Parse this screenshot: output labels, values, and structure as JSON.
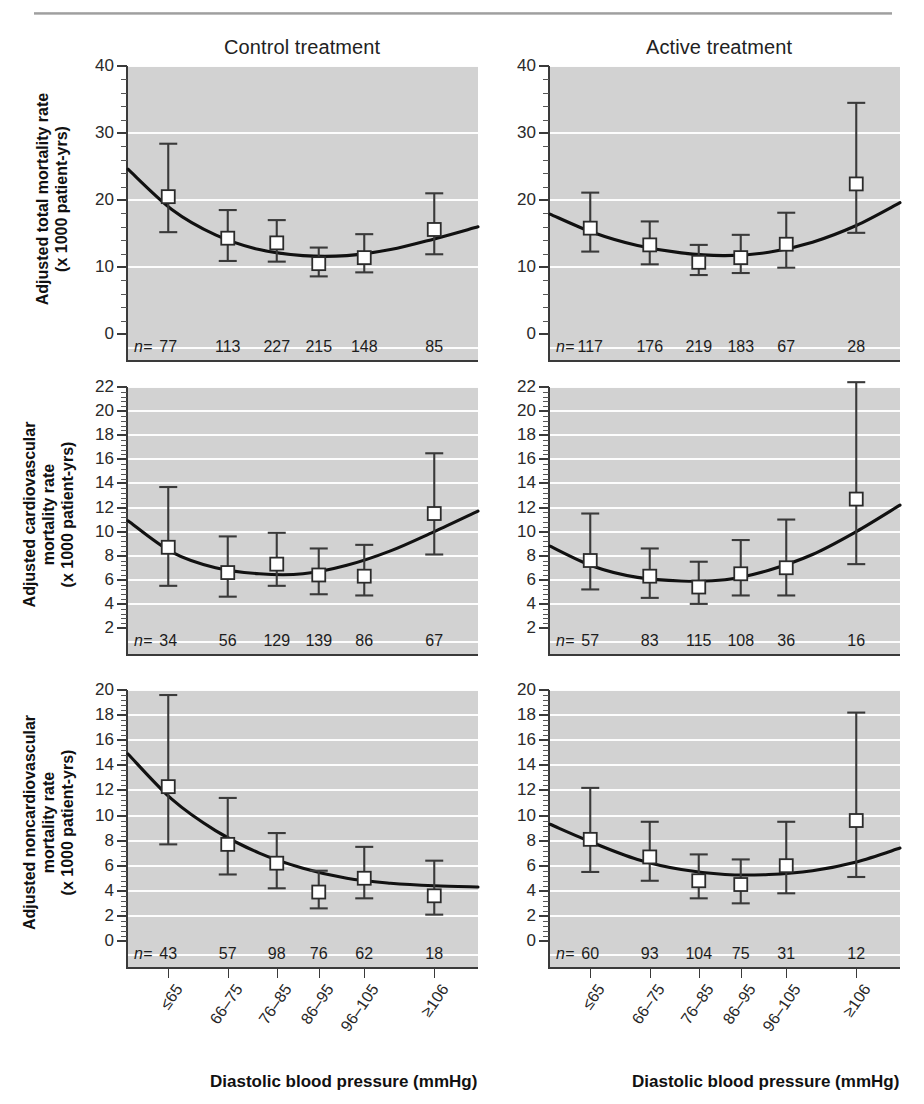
{
  "figure": {
    "column_titles": [
      "Control treatment",
      "Active treatment"
    ],
    "xaxis_title": "Diastolic blood pressure (mmHg)",
    "n_prefix": "n=",
    "x_tick_labels": [
      "≤65",
      "66–75",
      "76–85",
      "86–95",
      "96–105",
      "≥106"
    ],
    "colors": {
      "plot_background": "#d2d2d2",
      "gridline": "#ffffff",
      "curve": "#111111",
      "marker_fill": "#ffffff",
      "marker_stroke": "#2b2b2b",
      "error_bar": "#3a3a3a",
      "text": "#1a1a1a"
    }
  },
  "chart_data": [
    {
      "type": "scatter",
      "panel_id": "total-control",
      "title": "Control treatment",
      "ylabel": "Adjusted total mortality rate\n(x 1000 patient-yrs)",
      "xlabel": "Diastolic blood pressure (mmHg)",
      "categories": [
        "≤65",
        "66–75",
        "76–85",
        "86–95",
        "96–105",
        "≥106"
      ],
      "ylim": [
        0,
        40
      ],
      "yticks": [
        0,
        10,
        20,
        30,
        40
      ],
      "grid": true,
      "values": [
        20.5,
        14.3,
        13.6,
        10.5,
        11.4,
        15.6
      ],
      "ci_low": [
        15.2,
        10.9,
        10.8,
        8.6,
        9.2,
        11.9
      ],
      "ci_high": [
        28.4,
        18.5,
        17.0,
        12.9,
        14.9,
        21.0
      ],
      "n": [
        77,
        113,
        227,
        215,
        148,
        85
      ],
      "curve": [
        24.6,
        18.6,
        14.8,
        12.6,
        11.7,
        11.7,
        12.6,
        14.2,
        16.0
      ]
    },
    {
      "type": "scatter",
      "panel_id": "total-active",
      "title": "Active treatment",
      "ylabel": "Adjusted total mortality rate\n(x 1000 patient-yrs)",
      "xlabel": "Diastolic blood pressure (mmHg)",
      "categories": [
        "≤65",
        "66–75",
        "76–85",
        "86–95",
        "96–105",
        "≥106"
      ],
      "ylim": [
        0,
        40
      ],
      "yticks": [
        0,
        10,
        20,
        30,
        40
      ],
      "grid": true,
      "values": [
        15.8,
        13.3,
        10.7,
        11.4,
        13.4,
        22.4
      ],
      "ci_low": [
        12.3,
        10.4,
        8.8,
        9.1,
        9.9,
        15.1
      ],
      "ci_high": [
        21.1,
        16.8,
        13.3,
        14.8,
        18.1,
        34.5
      ],
      "n": [
        117,
        176,
        219,
        183,
        67,
        28
      ],
      "curve": [
        17.9,
        15.1,
        13.2,
        12.1,
        11.7,
        12.2,
        13.7,
        16.2,
        19.6
      ]
    },
    {
      "type": "scatter",
      "panel_id": "cv-control",
      "title": "Control treatment",
      "ylabel": "Adjusted cardiovascular\nmortality rate\n(x 1000 patient-yrs)",
      "xlabel": "Diastolic blood pressure (mmHg)",
      "categories": [
        "≤65",
        "66–75",
        "76–85",
        "86–95",
        "96–105",
        "≥106"
      ],
      "ylim": [
        2,
        22
      ],
      "yticks": [
        2,
        4,
        6,
        8,
        10,
        12,
        14,
        16,
        18,
        20,
        22
      ],
      "grid": true,
      "values": [
        8.7,
        6.6,
        7.3,
        6.4,
        6.3,
        11.5
      ],
      "ci_low": [
        5.5,
        4.6,
        5.5,
        4.8,
        4.7,
        8.1
      ],
      "ci_high": [
        13.7,
        9.6,
        9.9,
        8.6,
        8.9,
        16.5
      ],
      "n": [
        34,
        56,
        129,
        139,
        86,
        67
      ],
      "curve": [
        10.9,
        8.3,
        7.0,
        6.5,
        6.5,
        7.2,
        8.4,
        10.0,
        11.7
      ]
    },
    {
      "type": "scatter",
      "panel_id": "cv-active",
      "title": "Active treatment",
      "ylabel": "Adjusted cardiovascular\nmortality rate\n(x 1000 patient-yrs)",
      "xlabel": "Diastolic blood pressure (mmHg)",
      "categories": [
        "≤65",
        "66–75",
        "76–85",
        "86–95",
        "96–105",
        "≥106"
      ],
      "ylim": [
        2,
        22
      ],
      "yticks": [
        2,
        4,
        6,
        8,
        10,
        12,
        14,
        16,
        18,
        20,
        22
      ],
      "grid": true,
      "values": [
        7.6,
        6.3,
        5.4,
        6.5,
        7.0,
        12.7
      ],
      "ci_low": [
        5.2,
        4.5,
        4.0,
        4.7,
        4.7,
        7.3
      ],
      "ci_high": [
        11.5,
        8.6,
        7.5,
        9.3,
        11.0,
        22.4
      ],
      "n": [
        57,
        83,
        115,
        108,
        36,
        16
      ],
      "curve": [
        8.8,
        7.1,
        6.2,
        5.9,
        6.0,
        6.8,
        8.1,
        10.0,
        12.2
      ]
    },
    {
      "type": "scatter",
      "panel_id": "noncv-control",
      "title": "Control treatment",
      "ylabel": "Adjusted noncardiovascular\nmortality rate\n(x 1000 patient-yrs)",
      "xlabel": "Diastolic blood pressure (mmHg)",
      "categories": [
        "≤65",
        "66–75",
        "76–85",
        "86–95",
        "96–105",
        "≥106"
      ],
      "ylim": [
        0,
        20
      ],
      "yticks": [
        0,
        2,
        4,
        6,
        8,
        10,
        12,
        14,
        16,
        18,
        20
      ],
      "grid": true,
      "values": [
        12.3,
        7.7,
        6.2,
        3.9,
        5.0,
        3.6
      ],
      "ci_low": [
        7.7,
        5.3,
        4.2,
        2.6,
        3.4,
        2.1
      ],
      "ci_high": [
        19.6,
        11.4,
        8.6,
        5.6,
        7.5,
        6.4
      ],
      "n": [
        43,
        57,
        98,
        76,
        62,
        18
      ],
      "curve": [
        14.9,
        11.3,
        8.8,
        7.0,
        5.8,
        5.0,
        4.6,
        4.4,
        4.3
      ]
    },
    {
      "type": "scatter",
      "panel_id": "noncv-active",
      "title": "Active treatment",
      "ylabel": "Adjusted noncardiovascular\nmortality rate\n(x 1000 patient-yrs)",
      "xlabel": "Diastolic blood pressure (mmHg)",
      "categories": [
        "≤65",
        "66–75",
        "76–85",
        "86–95",
        "96–105",
        "≥106"
      ],
      "ylim": [
        0,
        20
      ],
      "yticks": [
        0,
        2,
        4,
        6,
        8,
        10,
        12,
        14,
        16,
        18,
        20
      ],
      "grid": true,
      "values": [
        8.1,
        6.7,
        4.8,
        4.5,
        6.0,
        9.6
      ],
      "ci_low": [
        5.5,
        4.8,
        3.4,
        3.0,
        3.8,
        5.1
      ],
      "ci_high": [
        12.2,
        9.5,
        6.9,
        6.5,
        9.5,
        18.2
      ],
      "n": [
        60,
        93,
        104,
        75,
        31,
        12
      ],
      "curve": [
        9.3,
        7.8,
        6.5,
        5.7,
        5.3,
        5.3,
        5.6,
        6.3,
        7.4
      ]
    }
  ],
  "rows": [
    {
      "ylabel_line1": "Adjusted total mortality rate",
      "ylabel_line2": "(x 1000 patient-yrs)"
    },
    {
      "ylabel_line1": "Adjusted cardiovascular",
      "ylabel_line2": "mortality rate",
      "ylabel_line3": "(x 1000 patient-yrs)"
    },
    {
      "ylabel_line1": "Adjusted noncardiovascular",
      "ylabel_line2": "mortality rate",
      "ylabel_line3": "(x 1000 patient-yrs)"
    }
  ]
}
